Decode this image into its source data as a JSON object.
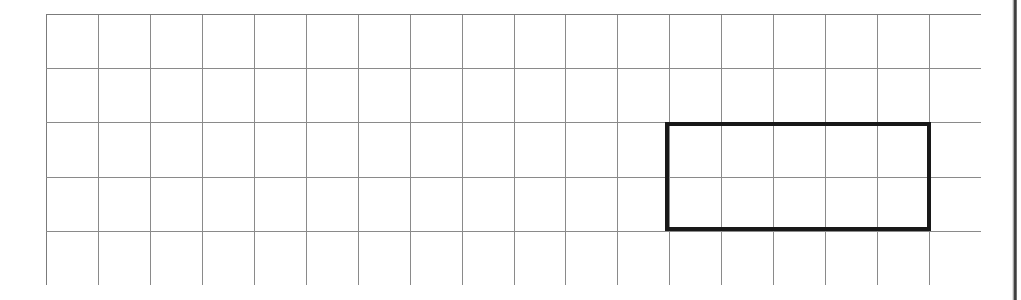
{
  "document": {
    "kind": "scanned-worksheet",
    "background_color": "#ffffff"
  },
  "page_edge": {
    "present": true,
    "side": "right",
    "color": "#2b2b2b",
    "x": 1012,
    "width": 5
  },
  "grid": {
    "label": "graph-paper-grid",
    "columns": 18,
    "rows": 5,
    "origin_x": 46,
    "origin_y": 14,
    "width": 935,
    "height": 271,
    "cell_width": 51.94,
    "cell_height": 54.2,
    "line_color": "#8a8a8a",
    "outer_line_color": "#7b7b7b",
    "line_width": 1.4
  },
  "shape": {
    "name": "rectangle",
    "type": "rect",
    "stroke_color": "#181818",
    "stroke_width": 4,
    "fill": "none",
    "grid_start_col": 12,
    "grid_start_row": 2,
    "grid_span_cols": 5,
    "grid_span_rows": 2,
    "x": 665,
    "y": 122,
    "width": 266,
    "height": 109
  },
  "chart_data": {
    "type": "table",
    "title": "",
    "xlabel": "",
    "ylabel": "",
    "categories": [
      "grid columns",
      "grid rows",
      "rectangle width (cells)",
      "rectangle height (cells)",
      "rectangle area (cells)",
      "rectangle perimeter (cells)"
    ],
    "values": [
      18,
      5,
      5,
      2,
      10,
      14
    ],
    "grid": true,
    "legend": "none"
  }
}
